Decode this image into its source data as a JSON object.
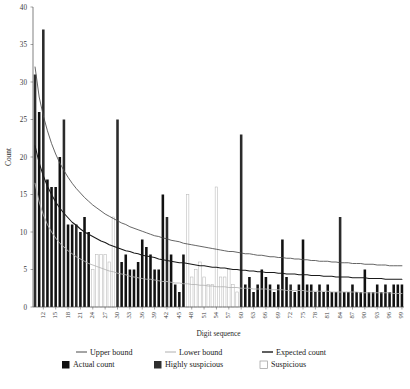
{
  "chart_data": {
    "type": "bar",
    "title": "",
    "xlabel": "Digit sequence",
    "ylabel": "Count",
    "ylim": [
      0,
      40
    ],
    "yticks": [
      0,
      5,
      10,
      15,
      20,
      25,
      30,
      35,
      40
    ],
    "grid": false,
    "legend_position": "bottom",
    "x": [
      10,
      11,
      12,
      13,
      14,
      15,
      16,
      17,
      18,
      19,
      20,
      21,
      22,
      23,
      24,
      25,
      26,
      27,
      28,
      29,
      30,
      31,
      32,
      33,
      34,
      35,
      36,
      37,
      38,
      39,
      40,
      41,
      42,
      43,
      44,
      45,
      46,
      47,
      48,
      49,
      50,
      51,
      52,
      53,
      54,
      55,
      56,
      57,
      58,
      59,
      60,
      61,
      62,
      63,
      64,
      65,
      66,
      67,
      68,
      69,
      70,
      71,
      72,
      73,
      74,
      75,
      76,
      77,
      78,
      79,
      80,
      81,
      82,
      83,
      84,
      85,
      86,
      87,
      88,
      89,
      90,
      91,
      92,
      93,
      94,
      95,
      96,
      97,
      98,
      99
    ],
    "xtick_labels": [
      "12",
      "15",
      "18",
      "21",
      "24",
      "27",
      "30",
      "33",
      "36",
      "39",
      "42",
      "45",
      "48",
      "51",
      "54",
      "57",
      "60",
      "63",
      "66",
      "69",
      "72",
      "75",
      "78",
      "81",
      "84",
      "87",
      "90",
      "93",
      "96",
      "99"
    ],
    "categories": [
      "10",
      "11",
      "12",
      "13",
      "14",
      "15",
      "16",
      "17",
      "18",
      "19",
      "20",
      "21",
      "22",
      "23",
      "24",
      "25",
      "26",
      "27",
      "28",
      "29",
      "30",
      "31",
      "32",
      "33",
      "34",
      "35",
      "36",
      "37",
      "38",
      "39",
      "40",
      "41",
      "42",
      "43",
      "44",
      "45",
      "46",
      "47",
      "48",
      "49",
      "50",
      "51",
      "52",
      "53",
      "54",
      "55",
      "56",
      "57",
      "58",
      "59",
      "60",
      "61",
      "62",
      "63",
      "64",
      "65",
      "66",
      "67",
      "68",
      "69",
      "70",
      "71",
      "72",
      "73",
      "74",
      "75",
      "76",
      "77",
      "78",
      "79",
      "80",
      "81",
      "82",
      "83",
      "84",
      "85",
      "86",
      "87",
      "88",
      "89",
      "90",
      "91",
      "92",
      "93",
      "94",
      "95",
      "96",
      "97",
      "98",
      "99"
    ],
    "series": [
      {
        "name": "Actual count",
        "type": "bar",
        "category_per_point": [
          "highly_suspicious",
          "actual",
          "highly_suspicious",
          "actual",
          "actual",
          "actual",
          "actual",
          "highly_suspicious",
          "actual",
          "actual",
          "highly_suspicious",
          "actual",
          "actual",
          "actual",
          "suspicious",
          "suspicious",
          "suspicious",
          "suspicious",
          "suspicious",
          "suspicious",
          "highly_suspicious",
          "actual",
          "actual",
          "actual",
          "actual",
          "actual",
          "actual",
          "actual",
          "actual",
          "actual",
          "actual",
          "actual",
          "highly_suspicious",
          "actual",
          "actual",
          "actual",
          "actual",
          "suspicious",
          "suspicious",
          "suspicious",
          "suspicious",
          "suspicious",
          "suspicious",
          "suspicious",
          "suspicious",
          "suspicious",
          "suspicious",
          "suspicious",
          "suspicious",
          "suspicious",
          "highly_suspicious",
          "actual",
          "actual",
          "actual",
          "actual",
          "actual",
          "actual",
          "actual",
          "actual",
          "actual",
          "actual",
          "actual",
          "highly_suspicious",
          "actual",
          "actual",
          "actual",
          "actual",
          "actual",
          "highly_suspicious",
          "actual",
          "actual",
          "actual",
          "actual",
          "actual",
          "highly_suspicious",
          "actual",
          "actual",
          "actual",
          "actual",
          "actual",
          "actual",
          "actual",
          "actual",
          "actual",
          "actual",
          "actual",
          "actual",
          "actual",
          "actual",
          "actual"
        ],
        "values": [
          31,
          26,
          37,
          17,
          16,
          16,
          20,
          25,
          11,
          11,
          11,
          10,
          12,
          10,
          5,
          7,
          7,
          7,
          6,
          12,
          25,
          6,
          7,
          5,
          5,
          6,
          9,
          8,
          7,
          5,
          5,
          15,
          12,
          7,
          3,
          2,
          7,
          15,
          4,
          5,
          6,
          4,
          3,
          3,
          16,
          4,
          4,
          5,
          3,
          2,
          23,
          3,
          4,
          2,
          3,
          5,
          4,
          3,
          2,
          3,
          9,
          4,
          3,
          2,
          3,
          9,
          3,
          3,
          2,
          3,
          2,
          3,
          2,
          2,
          12,
          2,
          2,
          3,
          2,
          2,
          5,
          2,
          2,
          3,
          2,
          3,
          2,
          3,
          3,
          3
        ]
      },
      {
        "name": "Upper bound",
        "type": "line",
        "values": [
          32.0,
          28.0,
          25.5,
          23.5,
          21.8,
          20.4,
          19.2,
          18.2,
          17.3,
          16.5,
          15.8,
          15.2,
          14.6,
          14.1,
          13.6,
          13.2,
          12.8,
          12.4,
          12.1,
          11.8,
          11.5,
          11.2,
          11.0,
          10.7,
          10.5,
          10.3,
          10.1,
          9.9,
          9.7,
          9.5,
          9.4,
          9.2,
          9.1,
          8.9,
          8.8,
          8.7,
          8.5,
          8.4,
          8.3,
          8.2,
          8.1,
          8.0,
          7.9,
          7.8,
          7.7,
          7.6,
          7.5,
          7.4,
          7.4,
          7.3,
          7.2,
          7.1,
          7.1,
          7.0,
          6.9,
          6.9,
          6.8,
          6.7,
          6.7,
          6.6,
          6.6,
          6.5,
          6.5,
          6.4,
          6.4,
          6.3,
          6.3,
          6.2,
          6.2,
          6.1,
          6.1,
          6.1,
          6.0,
          6.0,
          5.9,
          5.9,
          5.9,
          5.8,
          5.8,
          5.8,
          5.7,
          5.7,
          5.7,
          5.6,
          5.6,
          5.6,
          5.5,
          5.5,
          5.5,
          5.5
        ]
      },
      {
        "name": "Expected count",
        "type": "line",
        "values": [
          21.5,
          19.2,
          17.5,
          16.1,
          15.0,
          14.0,
          13.2,
          12.5,
          11.9,
          11.3,
          10.9,
          10.4,
          10.0,
          9.7,
          9.4,
          9.1,
          8.8,
          8.6,
          8.3,
          8.1,
          7.9,
          7.7,
          7.5,
          7.4,
          7.2,
          7.1,
          6.9,
          6.8,
          6.7,
          6.6,
          6.4,
          6.3,
          6.2,
          6.1,
          6.0,
          5.9,
          5.9,
          5.8,
          5.7,
          5.6,
          5.5,
          5.5,
          5.4,
          5.3,
          5.3,
          5.2,
          5.2,
          5.1,
          5.0,
          5.0,
          4.9,
          4.9,
          4.8,
          4.8,
          4.7,
          4.7,
          4.6,
          4.6,
          4.6,
          4.5,
          4.5,
          4.4,
          4.4,
          4.4,
          4.3,
          4.3,
          4.3,
          4.2,
          4.2,
          4.2,
          4.1,
          4.1,
          4.1,
          4.0,
          4.0,
          4.0,
          4.0,
          3.9,
          3.9,
          3.9,
          3.9,
          3.8,
          3.8,
          3.8,
          3.8,
          3.7,
          3.7,
          3.7,
          3.7,
          3.7
        ]
      },
      {
        "name": "Lower bound",
        "type": "line",
        "values": [
          16.5,
          14.0,
          12.3,
          11.0,
          10.0,
          9.2,
          8.5,
          8.0,
          7.5,
          7.1,
          6.7,
          6.4,
          6.1,
          5.8,
          5.6,
          5.4,
          5.2,
          5.0,
          4.8,
          4.7,
          4.5,
          4.4,
          4.3,
          4.1,
          4.0,
          3.9,
          3.8,
          3.7,
          3.7,
          3.6,
          3.5,
          3.4,
          3.4,
          3.3,
          3.2,
          3.2,
          3.1,
          3.1,
          3.0,
          3.0,
          2.9,
          2.9,
          2.8,
          2.8,
          2.7,
          2.7,
          2.7,
          2.6,
          2.6,
          2.6,
          2.5,
          2.5,
          2.5,
          2.4,
          2.4,
          2.4,
          2.4,
          2.3,
          2.3,
          2.3,
          2.3,
          2.2,
          2.2,
          2.2,
          2.2,
          2.2,
          2.1,
          2.1,
          2.1,
          2.1,
          2.1,
          2.1,
          2.0,
          2.0,
          2.0,
          2.0,
          2.0,
          2.0,
          2.0,
          1.9,
          1.9,
          1.9,
          1.9,
          1.9,
          1.9,
          1.9,
          1.9,
          1.8,
          1.8,
          1.8
        ]
      }
    ]
  },
  "axes": {
    "y_title": "Count",
    "x_title": "Digit sequence"
  },
  "legend": {
    "row1": [
      {
        "label": "Upper bound",
        "marker": "line",
        "color": "#4a4a4a"
      },
      {
        "label": "Lower bound",
        "marker": "line",
        "color": "#b0b0b0"
      },
      {
        "label": "Expected count",
        "marker": "line",
        "color": "#1a1a1a"
      }
    ],
    "row2": [
      {
        "label": "Actual count",
        "marker": "swatch",
        "color": "#111111"
      },
      {
        "label": "Highly suspicious",
        "marker": "swatch",
        "color": "#2e2e2e"
      },
      {
        "label": "Suspicious",
        "marker": "swatch-outline",
        "color": "#ffffff"
      }
    ]
  },
  "colors": {
    "actual": "#111111",
    "highly_suspicious": "#2b2b2b",
    "suspicious_fill": "#ffffff",
    "suspicious_stroke": "#b8b8b8",
    "upper_bound": "#4a4a4a",
    "expected": "#1a1a1a",
    "lower_bound": "#b4b4b4",
    "axis": "#4a4a4a",
    "text": "#1a1a1a"
  }
}
